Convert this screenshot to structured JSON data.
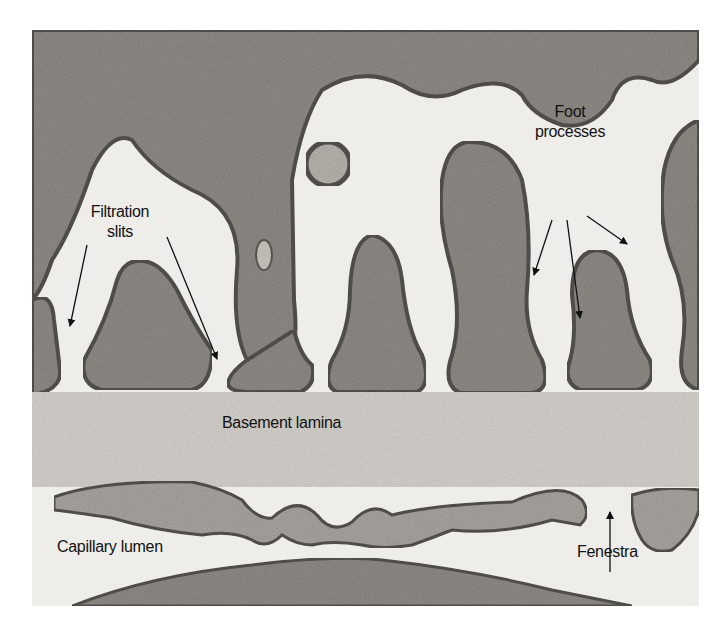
{
  "figure": {
    "type": "transmission electron micrograph",
    "background_color": "#d8d6d2",
    "membrane_color": "#55524e",
    "cytoplasm_color": "#8f8b86",
    "lumen_color": "#eeedea"
  },
  "labels": {
    "foot_processes_line1": "Foot",
    "foot_processes_line2": "processes",
    "filtration_slits_line1": "Filtration",
    "filtration_slits_line2": "slits",
    "basement_lamina": "Basement lamina",
    "capillary_lumen": "Capillary lumen",
    "fenestra": "Fenestra"
  }
}
